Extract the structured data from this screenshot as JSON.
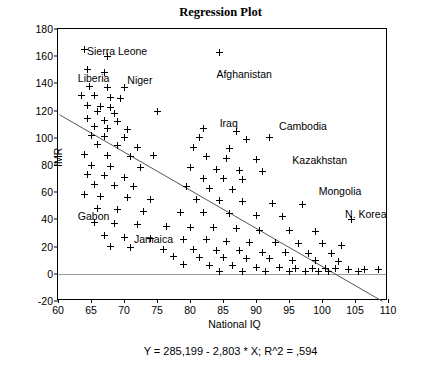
{
  "chart_data": {
    "type": "scatter",
    "title": "Regression Plot",
    "xlabel": "National IQ",
    "ylabel": "IMR",
    "equation": "Y = 285,199 - 2,803 * X; R^2 = ,594",
    "xlim": [
      60,
      110
    ],
    "ylim": [
      -20,
      180
    ],
    "xticks": [
      60,
      65,
      70,
      75,
      80,
      85,
      90,
      95,
      100,
      105,
      110
    ],
    "yticks": [
      -20,
      0,
      20,
      40,
      60,
      80,
      100,
      120,
      140,
      160,
      180
    ],
    "grid": false,
    "legend": null,
    "regression": {
      "intercept": 285.199,
      "slope": -2.803,
      "r2": 0.594,
      "x_from": 60.2,
      "x_to": 109.5
    },
    "annotations": [
      {
        "label": "Sierra Leone",
        "x": 64.4,
        "y": 163
      },
      {
        "label": "Liberia",
        "x": 63.0,
        "y": 143
      },
      {
        "label": "Niger",
        "x": 70.5,
        "y": 142
      },
      {
        "label": "Afghanistan",
        "x": 84.0,
        "y": 146
      },
      {
        "label": "Iraq",
        "x": 84.5,
        "y": 110
      },
      {
        "label": "Cambodia",
        "x": 93.5,
        "y": 108
      },
      {
        "label": "Kazakhstan",
        "x": 95.5,
        "y": 83
      },
      {
        "label": "Mongolia",
        "x": 99.5,
        "y": 60
      },
      {
        "label": "N. Korea",
        "x": 103.5,
        "y": 43
      },
      {
        "label": "Gabon",
        "x": 63.0,
        "y": 42
      },
      {
        "label": "Jamaica",
        "x": 71.5,
        "y": 25
      }
    ],
    "points": [
      [
        64.0,
        165
      ],
      [
        67.5,
        160
      ],
      [
        84.5,
        163
      ],
      [
        64.5,
        150
      ],
      [
        67.0,
        148
      ],
      [
        64.8,
        138
      ],
      [
        67.5,
        137
      ],
      [
        70.0,
        137
      ],
      [
        63.5,
        131
      ],
      [
        65.5,
        131
      ],
      [
        68.0,
        130
      ],
      [
        69.5,
        129
      ],
      [
        64.5,
        124
      ],
      [
        66.5,
        123
      ],
      [
        68.0,
        122
      ],
      [
        66.0,
        119
      ],
      [
        68.5,
        118
      ],
      [
        75.0,
        119
      ],
      [
        64.5,
        114
      ],
      [
        67.0,
        113
      ],
      [
        69.0,
        112
      ],
      [
        65.5,
        108
      ],
      [
        67.5,
        107
      ],
      [
        70.5,
        106
      ],
      [
        82.0,
        107
      ],
      [
        87.0,
        105
      ],
      [
        65.0,
        102
      ],
      [
        67.0,
        101
      ],
      [
        70.0,
        100
      ],
      [
        81.5,
        100
      ],
      [
        88.5,
        99
      ],
      [
        92.0,
        100
      ],
      [
        66.0,
        95
      ],
      [
        69.0,
        94
      ],
      [
        72.0,
        93
      ],
      [
        80.5,
        93
      ],
      [
        86.0,
        92
      ],
      [
        64.0,
        88
      ],
      [
        67.5,
        87
      ],
      [
        71.0,
        86
      ],
      [
        74.5,
        87
      ],
      [
        82.5,
        86
      ],
      [
        85.5,
        85
      ],
      [
        90.0,
        84
      ],
      [
        65.0,
        80
      ],
      [
        68.0,
        79
      ],
      [
        72.5,
        78
      ],
      [
        80.0,
        78
      ],
      [
        84.0,
        77
      ],
      [
        87.5,
        76
      ],
      [
        91.0,
        75
      ],
      [
        64.5,
        73
      ],
      [
        67.0,
        72
      ],
      [
        70.0,
        71
      ],
      [
        82.0,
        70
      ],
      [
        85.0,
        70
      ],
      [
        88.0,
        69
      ],
      [
        65.5,
        66
      ],
      [
        68.5,
        65
      ],
      [
        71.5,
        64
      ],
      [
        79.5,
        64
      ],
      [
        83.0,
        63
      ],
      [
        86.5,
        62
      ],
      [
        64.0,
        58
      ],
      [
        66.5,
        57
      ],
      [
        70.5,
        56
      ],
      [
        74.0,
        55
      ],
      [
        81.0,
        55
      ],
      [
        84.5,
        54
      ],
      [
        88.0,
        53
      ],
      [
        92.5,
        52
      ],
      [
        97.0,
        51
      ],
      [
        66.0,
        48
      ],
      [
        69.0,
        47
      ],
      [
        73.0,
        46
      ],
      [
        78.5,
        45
      ],
      [
        82.0,
        45
      ],
      [
        86.0,
        44
      ],
      [
        90.0,
        43
      ],
      [
        94.0,
        42
      ],
      [
        104.5,
        40
      ],
      [
        65.5,
        38
      ],
      [
        68.5,
        37
      ],
      [
        72.0,
        36
      ],
      [
        76.5,
        35
      ],
      [
        80.0,
        34
      ],
      [
        83.5,
        34
      ],
      [
        87.0,
        33
      ],
      [
        90.5,
        32
      ],
      [
        95.0,
        32
      ],
      [
        99.0,
        31
      ],
      [
        67.0,
        28
      ],
      [
        70.0,
        27
      ],
      [
        74.0,
        26
      ],
      [
        79.0,
        25
      ],
      [
        82.5,
        25
      ],
      [
        85.5,
        24
      ],
      [
        89.0,
        23
      ],
      [
        93.0,
        23
      ],
      [
        96.5,
        22
      ],
      [
        100.0,
        22
      ],
      [
        103.0,
        21
      ],
      [
        68.0,
        20
      ],
      [
        71.0,
        19
      ],
      [
        76.0,
        18
      ],
      [
        80.5,
        18
      ],
      [
        84.0,
        17
      ],
      [
        87.5,
        17
      ],
      [
        91.0,
        16
      ],
      [
        94.5,
        16
      ],
      [
        98.0,
        15
      ],
      [
        101.5,
        15
      ],
      [
        77.5,
        13
      ],
      [
        81.5,
        12
      ],
      [
        85.0,
        12
      ],
      [
        88.5,
        11
      ],
      [
        92.0,
        11
      ],
      [
        95.5,
        10
      ],
      [
        99.0,
        10
      ],
      [
        102.5,
        9
      ],
      [
        79.0,
        7
      ],
      [
        83.0,
        6
      ],
      [
        86.5,
        6
      ],
      [
        90.0,
        5
      ],
      [
        93.5,
        5
      ],
      [
        96.0,
        4
      ],
      [
        98.5,
        4
      ],
      [
        100.5,
        4
      ],
      [
        102.0,
        4
      ],
      [
        104.0,
        3
      ],
      [
        106.5,
        3
      ],
      [
        108.5,
        3
      ],
      [
        84.5,
        2
      ],
      [
        88.0,
        2
      ],
      [
        91.5,
        2
      ],
      [
        95.0,
        2
      ],
      [
        97.5,
        2
      ],
      [
        99.5,
        2
      ],
      [
        101.0,
        2
      ],
      [
        105.5,
        2
      ]
    ]
  }
}
